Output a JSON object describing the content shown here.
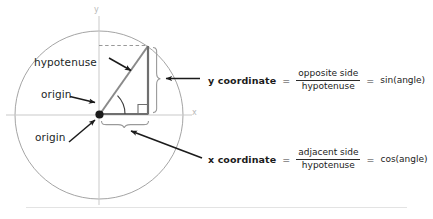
{
  "diagram": {
    "title_labels": {
      "hypotenuse": "hypotenuse",
      "origin_upper": "origin",
      "origin_lower": "origin"
    },
    "axes": {
      "x_label": "x",
      "y_label": "y"
    },
    "colors": {
      "circle_stroke": "#9a9a9a",
      "axis_stroke": "#c9c9c9",
      "triangle_stroke": "#7d7d7d",
      "leg_stroke": "#6f6f6f",
      "arrow": "#1b1b1b",
      "brace": "#9a9a9a",
      "dashed": "#8d8d8d",
      "text": "#221f1f",
      "divider": "#e3e3e3"
    }
  },
  "equations": [
    {
      "name": "y coordinate",
      "equals": "=",
      "numerator": "opposite side",
      "denominator": "hypotenuse",
      "equals2": "=",
      "result": "sin(angle)"
    },
    {
      "name": "x coordinate",
      "equals": "=",
      "numerator": "adjacent side",
      "denominator": "hypotenuse",
      "equals2": "=",
      "result": "cos(angle)"
    }
  ]
}
